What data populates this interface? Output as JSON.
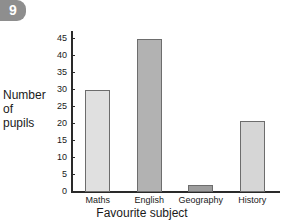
{
  "badge": {
    "number": "9"
  },
  "chart_data": {
    "type": "bar",
    "title": "",
    "categories": [
      "Maths",
      "English",
      "Geography",
      "History"
    ],
    "values": [
      30,
      45,
      2,
      21
    ],
    "series": [
      {
        "name": "Number of pupils",
        "values": [
          30,
          45,
          2,
          21
        ]
      }
    ],
    "xlabel": "Favourite subject",
    "ylabel_lines": [
      "Number",
      "of",
      "pupils"
    ],
    "ylabel": "Number of pupils",
    "ylim": [
      0,
      47
    ],
    "ytick_values": [
      0,
      5,
      10,
      15,
      20,
      25,
      30,
      35,
      40,
      45
    ],
    "ytick_labels": [
      "0",
      "5",
      "10",
      "15",
      "20",
      "25",
      "30",
      "35",
      "40",
      "45"
    ],
    "grid": false,
    "legend": "none",
    "bar_colors": [
      "#e0e0e0",
      "#b2b2b2",
      "#9d9d9d",
      "#d6d6d6"
    ],
    "bar_edge_color": "#6d6d6d",
    "axis_color": "#2a2a2a"
  },
  "colors": {
    "badge_background": "#8e8e8e",
    "badge_text": "#ffffff",
    "page_background": "#ffffff",
    "text": "#1a1a1a"
  }
}
